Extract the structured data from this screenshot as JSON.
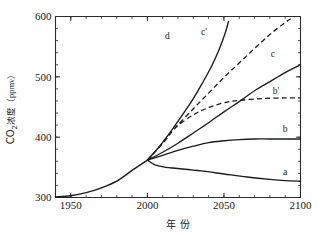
{
  "chart_data": {
    "type": "line",
    "title": "",
    "xlabel": "年 份",
    "ylabel_main": "CO",
    "ylabel_sub": "2",
    "ylabel_rest": "浓度（ppmv）",
    "ylabel_full": "CO2浓度（ppmv）",
    "xlim": [
      1940,
      2100
    ],
    "ylim": [
      300,
      600
    ],
    "xticks": [
      1950,
      2000,
      2050,
      2100
    ],
    "xtick_labels": [
      "1950",
      "2000",
      "2050",
      "2100"
    ],
    "yticks": [
      300,
      400,
      500,
      600
    ],
    "ytick_labels": [
      "300",
      "400",
      "500",
      "600"
    ],
    "x_minor_step": 10,
    "y_minor_step": 20,
    "grid": false,
    "legend": "inline-curve-labels",
    "historical": {
      "name": "observed",
      "style": "solid",
      "points": [
        [
          1940,
          301
        ],
        [
          1950,
          303
        ],
        [
          1960,
          308
        ],
        [
          1970,
          316
        ],
        [
          1980,
          327
        ],
        [
          1990,
          345
        ],
        [
          2000,
          362
        ]
      ]
    },
    "series": [
      {
        "name": "a",
        "label": "a",
        "style": "solid",
        "label_x": 2090,
        "label_y": 337,
        "points": [
          [
            2000,
            362
          ],
          [
            2005,
            354
          ],
          [
            2012,
            350
          ],
          [
            2020,
            348
          ],
          [
            2035,
            344
          ],
          [
            2050,
            339
          ],
          [
            2065,
            334
          ],
          [
            2080,
            330
          ],
          [
            2090,
            328
          ],
          [
            2100,
            327
          ]
        ]
      },
      {
        "name": "b",
        "label": "b",
        "style": "solid",
        "label_x": 2090,
        "label_y": 408,
        "points": [
          [
            2000,
            362
          ],
          [
            2010,
            370
          ],
          [
            2020,
            378
          ],
          [
            2030,
            385
          ],
          [
            2040,
            391
          ],
          [
            2050,
            394
          ],
          [
            2060,
            396
          ],
          [
            2070,
            397
          ],
          [
            2085,
            397
          ],
          [
            2100,
            397
          ]
        ]
      },
      {
        "name": "b'",
        "label": "b'",
        "style": "dashed",
        "label_x": 2084,
        "label_y": 472,
        "points": [
          [
            2000,
            362
          ],
          [
            2010,
            390
          ],
          [
            2018,
            415
          ],
          [
            2030,
            437
          ],
          [
            2040,
            449
          ],
          [
            2050,
            457
          ],
          [
            2060,
            461
          ],
          [
            2075,
            464
          ],
          [
            2090,
            465
          ],
          [
            2100,
            465
          ]
        ]
      },
      {
        "name": "c",
        "label": "c",
        "style": "solid",
        "label_x": 2082,
        "label_y": 533,
        "points": [
          [
            2000,
            362
          ],
          [
            2010,
            375
          ],
          [
            2020,
            390
          ],
          [
            2030,
            407
          ],
          [
            2040,
            424
          ],
          [
            2050,
            442
          ],
          [
            2060,
            459
          ],
          [
            2070,
            477
          ],
          [
            2080,
            492
          ],
          [
            2090,
            507
          ],
          [
            2100,
            520
          ]
        ]
      },
      {
        "name": "c'",
        "label": "c'",
        "style": "dashed",
        "label_x": 2037,
        "label_y": 570,
        "points": [
          [
            2000,
            362
          ],
          [
            2010,
            390
          ],
          [
            2018,
            415
          ],
          [
            2030,
            447
          ],
          [
            2040,
            473
          ],
          [
            2050,
            499
          ],
          [
            2060,
            523
          ],
          [
            2070,
            547
          ],
          [
            2080,
            570
          ],
          [
            2090,
            590
          ],
          [
            2096,
            600
          ]
        ]
      },
      {
        "name": "d",
        "label": "d",
        "style": "solid",
        "label_x": 2013,
        "label_y": 562,
        "points": [
          [
            2000,
            362
          ],
          [
            2008,
            385
          ],
          [
            2016,
            412
          ],
          [
            2024,
            441
          ],
          [
            2030,
            464
          ],
          [
            2036,
            490
          ],
          [
            2042,
            518
          ],
          [
            2047,
            546
          ],
          [
            2051,
            574
          ],
          [
            2053,
            592
          ]
        ]
      }
    ]
  }
}
